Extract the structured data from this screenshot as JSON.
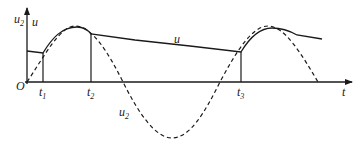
{
  "diagram": {
    "type": "waveform",
    "axes": {
      "origin_label": "O",
      "x_label": "t",
      "y_labels": [
        {
          "base": "u",
          "sub": "2"
        },
        {
          "base": "u",
          "sub": ""
        }
      ]
    },
    "time_marks": [
      {
        "base": "t",
        "sub": "1"
      },
      {
        "base": "t",
        "sub": "2"
      },
      {
        "base": "t",
        "sub": "3"
      }
    ],
    "curves": [
      {
        "name": "u",
        "style": "solid",
        "label": {
          "base": "u",
          "sub": ""
        }
      },
      {
        "name": "u2",
        "style": "dashed",
        "label": {
          "base": "u",
          "sub": "2"
        }
      }
    ],
    "colors": {
      "line": "#1a1a1a",
      "background": "#ffffff"
    }
  }
}
